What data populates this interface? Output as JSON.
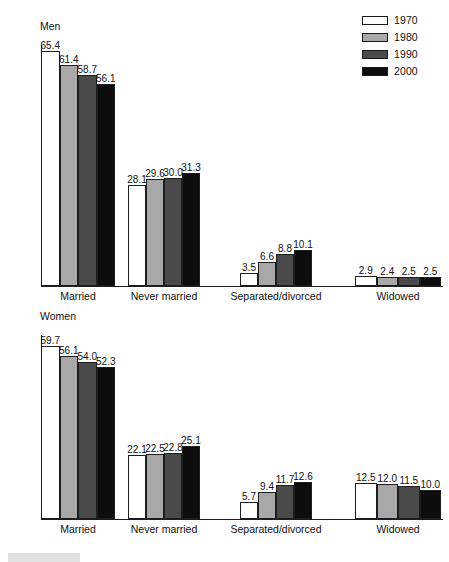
{
  "chart_data": {
    "type": "bar",
    "title": "",
    "categories": [
      "Married",
      "Never married",
      "Separated/divorced",
      "Widowed"
    ],
    "legend_position": "top-right",
    "grid": false,
    "panels": [
      {
        "title": "Men",
        "ylim": [
          0,
          65.4
        ],
        "series": [
          {
            "name": "1970",
            "color": "#ffffff",
            "values": [
              65.4,
              28.1,
              3.5,
              2.9
            ]
          },
          {
            "name": "1980",
            "color": "#a8a8a8",
            "values": [
              61.4,
              29.6,
              6.6,
              2.4
            ]
          },
          {
            "name": "1990",
            "color": "#4a4a4a",
            "values": [
              58.7,
              30.0,
              8.8,
              2.5
            ]
          },
          {
            "name": "2000",
            "color": "#0d0d0d",
            "values": [
              56.1,
              31.3,
              10.1,
              2.5
            ]
          }
        ]
      },
      {
        "title": "Women",
        "ylim": [
          0,
          59.7
        ],
        "series": [
          {
            "name": "1970",
            "color": "#ffffff",
            "values": [
              59.7,
              22.1,
              5.7,
              12.5
            ]
          },
          {
            "name": "1980",
            "color": "#a8a8a8",
            "values": [
              56.1,
              22.5,
              9.4,
              12.0
            ]
          },
          {
            "name": "1990",
            "color": "#4a4a4a",
            "values": [
              54.0,
              22.8,
              11.7,
              11.5
            ]
          },
          {
            "name": "2000",
            "color": "#0d0d0d",
            "values": [
              52.3,
              25.1,
              12.6,
              10.0
            ]
          }
        ]
      }
    ]
  },
  "legend": {
    "items": [
      {
        "label": "1970",
        "color": "#ffffff"
      },
      {
        "label": "1980",
        "color": "#a8a8a8"
      },
      {
        "label": "1990",
        "color": "#4a4a4a"
      },
      {
        "label": "2000",
        "color": "#0d0d0d"
      }
    ]
  }
}
